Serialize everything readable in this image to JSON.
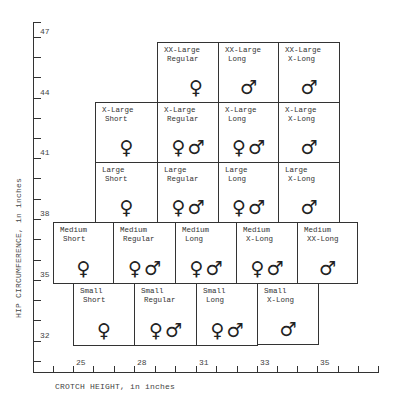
{
  "axes": {
    "y": {
      "title": "HIP CIRCUMFERENCE, in inches",
      "labels": [
        {
          "value": "47",
          "y": 37
        },
        {
          "value": "44",
          "y": 98
        },
        {
          "value": "41",
          "y": 158
        },
        {
          "value": "38",
          "y": 219
        },
        {
          "value": "35",
          "y": 280
        },
        {
          "value": "32",
          "y": 341
        }
      ],
      "ticks": [
        22,
        37,
        57,
        77,
        98,
        118,
        138,
        158,
        178,
        199,
        219,
        239,
        260,
        280,
        300,
        320,
        341,
        361
      ]
    },
    "x": {
      "title": "CROTCH HEIGHT, in inches",
      "labels": [
        {
          "value": "25",
          "x": 73
        },
        {
          "value": "28",
          "x": 134
        },
        {
          "value": "31",
          "x": 196
        },
        {
          "value": "33",
          "x": 257
        },
        {
          "value": "35",
          "x": 317
        }
      ],
      "ticks": [
        53,
        73,
        93,
        114,
        134,
        155,
        175,
        196,
        216,
        237,
        257,
        277,
        297,
        317,
        338,
        358,
        378
      ]
    }
  },
  "symbols": {
    "female": "♀",
    "male": "♂"
  },
  "cells": [
    {
      "size": "XX-Large",
      "length": "Regular",
      "symbols": [
        "female"
      ],
      "x": 157,
      "y": 42,
      "w": 62,
      "h": 61
    },
    {
      "size": "XX-Large",
      "length": "Long",
      "symbols": [
        "male"
      ],
      "x": 218,
      "y": 42,
      "w": 61,
      "h": 61
    },
    {
      "size": "XX-Large",
      "length": "X-Long",
      "symbols": [
        "male"
      ],
      "x": 278,
      "y": 42,
      "w": 62,
      "h": 61
    },
    {
      "size": "X-Large",
      "length": "Short",
      "symbols": [
        "female"
      ],
      "x": 95,
      "y": 102,
      "w": 63,
      "h": 61
    },
    {
      "size": "X-Large",
      "length": "Regular",
      "symbols": [
        "female",
        "male"
      ],
      "x": 157,
      "y": 102,
      "w": 62,
      "h": 61
    },
    {
      "size": "X-Large",
      "length": "Long",
      "symbols": [
        "female",
        "male"
      ],
      "x": 218,
      "y": 102,
      "w": 61,
      "h": 61
    },
    {
      "size": "X-Large",
      "length": "X-Long",
      "symbols": [
        "male"
      ],
      "x": 278,
      "y": 102,
      "w": 62,
      "h": 61
    },
    {
      "size": "Large",
      "length": "Short",
      "symbols": [
        "female"
      ],
      "x": 95,
      "y": 162,
      "w": 63,
      "h": 61
    },
    {
      "size": "Large",
      "length": "Regular",
      "symbols": [
        "female",
        "male"
      ],
      "x": 157,
      "y": 162,
      "w": 62,
      "h": 61
    },
    {
      "size": "Large",
      "length": "Long",
      "symbols": [
        "female",
        "male"
      ],
      "x": 218,
      "y": 162,
      "w": 61,
      "h": 61
    },
    {
      "size": "Large",
      "length": "X-Long",
      "symbols": [
        "male"
      ],
      "x": 278,
      "y": 162,
      "w": 62,
      "h": 61
    },
    {
      "size": "Medium",
      "length": "Short",
      "symbols": [
        "female"
      ],
      "x": 53,
      "y": 222,
      "w": 61,
      "h": 62
    },
    {
      "size": "Medium",
      "length": "Regular",
      "symbols": [
        "female",
        "male"
      ],
      "x": 113,
      "y": 222,
      "w": 63,
      "h": 62
    },
    {
      "size": "Medium",
      "length": "Long",
      "symbols": [
        "female",
        "male"
      ],
      "x": 175,
      "y": 222,
      "w": 62,
      "h": 62
    },
    {
      "size": "Medium",
      "length": "X-Long",
      "symbols": [
        "female",
        "male"
      ],
      "x": 236,
      "y": 222,
      "w": 62,
      "h": 62
    },
    {
      "size": "Medium",
      "length": "XX-Long",
      "symbols": [
        "male"
      ],
      "x": 297,
      "y": 222,
      "w": 61,
      "h": 62
    },
    {
      "size": "Small",
      "length": "Short",
      "symbols": [
        "female"
      ],
      "x": 73,
      "y": 283,
      "w": 62,
      "h": 63
    },
    {
      "size": "Small",
      "length": "Regular",
      "symbols": [
        "female",
        "male"
      ],
      "x": 134,
      "y": 283,
      "w": 63,
      "h": 63
    },
    {
      "size": "Small",
      "length": "Long",
      "symbols": [
        "female",
        "male"
      ],
      "x": 196,
      "y": 283,
      "w": 62,
      "h": 63
    },
    {
      "size": "Small",
      "length": "X-Long",
      "symbols": [
        "male"
      ],
      "x": 257,
      "y": 283,
      "w": 62,
      "h": 62
    }
  ]
}
